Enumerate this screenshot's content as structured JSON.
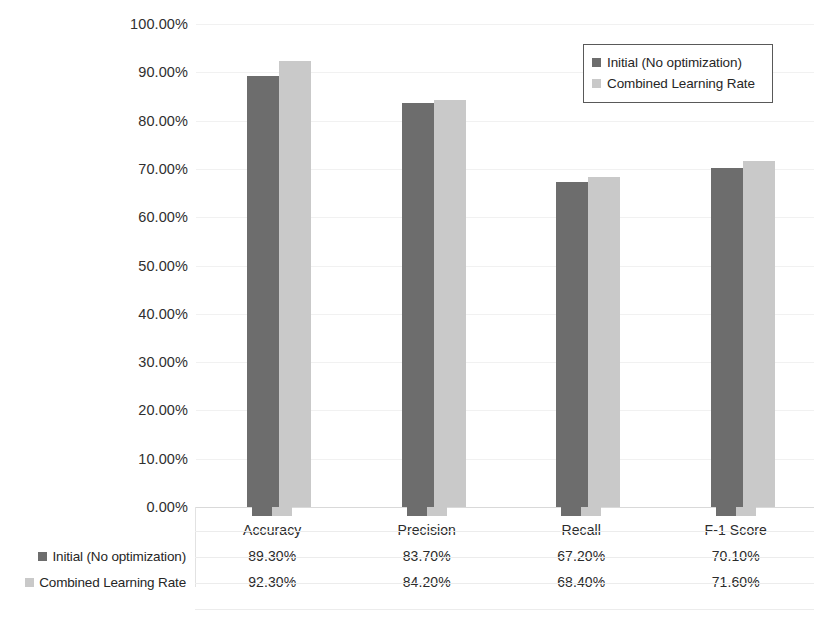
{
  "chart_data": {
    "type": "bar",
    "title": "",
    "xlabel": "",
    "ylabel": "",
    "ylim": [
      0,
      100
    ],
    "ytick_labels": [
      "100.00%",
      "90.00%",
      "80.00%",
      "70.00%",
      "60.00%",
      "50.00%",
      "40.00%",
      "30.00%",
      "20.00%",
      "10.00%",
      "0.00%"
    ],
    "ytick_values": [
      100,
      90,
      80,
      70,
      60,
      50,
      40,
      30,
      20,
      10,
      0
    ],
    "grid": true,
    "legend_position": "top-right",
    "categories": [
      "Accuracy",
      "Precision",
      "Recall",
      "F-1 Score"
    ],
    "series": [
      {
        "name": "Initial (No optimization)",
        "color": "#6d6d6d",
        "values": [
          89.3,
          83.7,
          67.2,
          70.1
        ],
        "labels": [
          "89.30%",
          "83.70%",
          "67.20%",
          "70.10%"
        ]
      },
      {
        "name": "Combined Learning Rate",
        "color": "#c9c9c9",
        "values": [
          92.3,
          84.2,
          68.4,
          71.6
        ],
        "labels": [
          "92.30%",
          "84.20%",
          "68.40%",
          "71.60%"
        ]
      }
    ]
  },
  "legend": {
    "items": [
      {
        "label": "Initial (No optimization)",
        "color": "#6d6d6d"
      },
      {
        "label": "Combined Learning Rate",
        "color": "#c9c9c9"
      }
    ]
  },
  "data_table": {
    "column_headers": [
      "Accuracy",
      "Precision",
      "Recall",
      "F-1 Score"
    ],
    "rows": [
      {
        "label": "Initial (No optimization)",
        "color": "#6d6d6d",
        "cells": [
          "89.30%",
          "83.70%",
          "67.20%",
          "70.10%"
        ]
      },
      {
        "label": "Combined Learning Rate",
        "color": "#c9c9c9",
        "cells": [
          "92.30%",
          "84.20%",
          "68.40%",
          "71.60%"
        ]
      }
    ]
  }
}
